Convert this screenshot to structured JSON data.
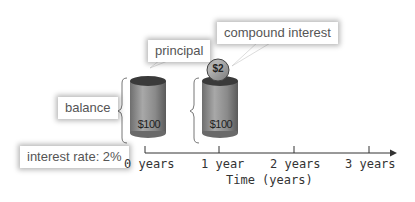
{
  "callouts": {
    "principal": "principal",
    "compound_interest": "compound interest",
    "balance": "balance",
    "interest_rate": "interest rate: 2%"
  },
  "cylinders": [
    {
      "year": 0,
      "label": "$100"
    },
    {
      "year": 1,
      "label": "$100",
      "coin": "$2"
    }
  ],
  "axis": {
    "ticks": [
      "0 years",
      "1 year",
      "2 years",
      "3 years"
    ],
    "title": "Time (years)"
  },
  "colors": {
    "cylinder_body": "#8a8a8a",
    "cylinder_top": "#3a3a3a",
    "axis": "#333333",
    "callout_text": "#555555"
  }
}
